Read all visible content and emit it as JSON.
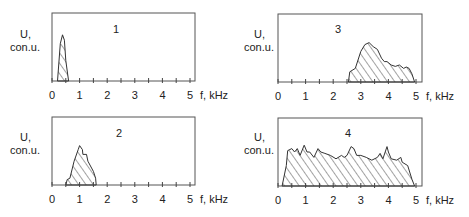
{
  "chart_data": [
    {
      "type": "area",
      "title": "1",
      "ylabel": "U, con.u.",
      "xlabel": "f, kHz",
      "xlim": [
        0,
        5
      ],
      "ylim": [
        0,
        1
      ],
      "xticks": [
        "0",
        "1",
        "2",
        "3",
        "4",
        "5"
      ],
      "x": [
        0.2,
        0.3,
        0.38,
        0.45,
        0.5,
        0.6
      ],
      "values": [
        0.0,
        0.55,
        0.68,
        0.6,
        0.3,
        0.0
      ]
    },
    {
      "type": "area",
      "title": "2",
      "ylabel": "U, con.u.",
      "xlabel": "f, kHz",
      "xlim": [
        0,
        5
      ],
      "ylim": [
        0,
        1
      ],
      "xticks": [
        "0",
        "1",
        "2",
        "3",
        "4",
        "5"
      ],
      "x": [
        0.5,
        0.55,
        0.65,
        0.8,
        0.95,
        1.0,
        1.1,
        1.12,
        1.25,
        1.3,
        1.5,
        1.58,
        1.6
      ],
      "values": [
        0.0,
        0.08,
        0.1,
        0.35,
        0.52,
        0.58,
        0.52,
        0.45,
        0.45,
        0.35,
        0.2,
        0.1,
        0.0
      ]
    },
    {
      "type": "area",
      "title": "3",
      "ylabel": "U, con.u.",
      "xlabel": "f, kHz",
      "xlim": [
        0,
        5
      ],
      "ylim": [
        0,
        1
      ],
      "xticks": [
        "0",
        "1",
        "2",
        "3",
        "4",
        "5"
      ],
      "x": [
        2.55,
        2.6,
        2.8,
        3.0,
        3.15,
        3.3,
        3.45,
        3.6,
        3.75,
        3.85,
        3.95,
        4.1,
        4.25,
        4.4,
        4.55,
        4.65,
        4.75,
        4.85,
        4.95
      ],
      "values": [
        0.0,
        0.15,
        0.2,
        0.45,
        0.55,
        0.58,
        0.52,
        0.48,
        0.35,
        0.3,
        0.3,
        0.25,
        0.23,
        0.25,
        0.2,
        0.22,
        0.2,
        0.12,
        0.0
      ]
    },
    {
      "type": "area",
      "title": "4",
      "ylabel": "U, con.u.",
      "xlabel": "f, kHz",
      "xlim": [
        0,
        5
      ],
      "ylim": [
        0,
        1
      ],
      "xticks": [
        "0",
        "1",
        "2",
        "3",
        "4",
        "5"
      ],
      "x": [
        0.15,
        0.3,
        0.35,
        0.5,
        0.6,
        0.7,
        0.8,
        0.95,
        1.05,
        1.15,
        1.3,
        1.45,
        1.55,
        1.7,
        1.9,
        2.1,
        2.3,
        2.4,
        2.5,
        2.65,
        2.75,
        2.85,
        3.0,
        3.2,
        3.4,
        3.6,
        3.7,
        3.8,
        3.95,
        4.0,
        4.1,
        4.3,
        4.45,
        4.5,
        4.7,
        4.85,
        4.95
      ],
      "values": [
        0.0,
        0.3,
        0.52,
        0.55,
        0.5,
        0.55,
        0.45,
        0.6,
        0.5,
        0.5,
        0.42,
        0.55,
        0.5,
        0.48,
        0.45,
        0.4,
        0.45,
        0.42,
        0.45,
        0.58,
        0.55,
        0.45,
        0.45,
        0.42,
        0.38,
        0.42,
        0.48,
        0.4,
        0.58,
        0.5,
        0.4,
        0.38,
        0.42,
        0.35,
        0.3,
        0.1,
        0.0
      ]
    }
  ],
  "panels": [
    {
      "id": "1",
      "ylabel_line1": "U,",
      "ylabel_line2": "con.u.",
      "xlabel": "f, kHz"
    },
    {
      "id": "2",
      "ylabel_line1": "U,",
      "ylabel_line2": "con.u.",
      "xlabel": "f, kHz"
    },
    {
      "id": "3",
      "ylabel_line1": "U,",
      "ylabel_line2": "con.u.",
      "xlabel": "f, kHz"
    },
    {
      "id": "4",
      "ylabel_line1": "U,",
      "ylabel_line2": "con.u.",
      "xlabel": "f, kHz"
    }
  ]
}
